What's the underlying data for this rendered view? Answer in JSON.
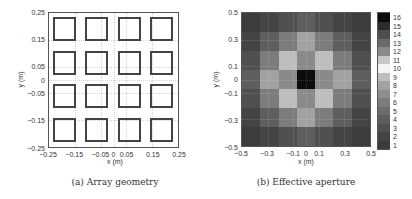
{
  "chart_data": [
    {
      "type": "scatter",
      "title": "",
      "caption": "(a)  Array geometry",
      "xlabel": "x (m)",
      "ylabel": "y (m)",
      "xlim": [
        -0.25,
        0.25
      ],
      "ylim": [
        -0.25,
        0.25
      ],
      "xticks": [
        "-0.25",
        "-0.15",
        "-0.05",
        "0",
        "0.05",
        "0.15",
        "0.25"
      ],
      "yticks": [
        "0.25",
        "0.15",
        "0.05",
        "0",
        "-0.05",
        "-0.15",
        "-0.25"
      ],
      "grid": true,
      "elements": {
        "shape": "square outline",
        "rows": 4,
        "cols": 4,
        "centers_x": [
          -0.1875,
          -0.0625,
          0.0625,
          0.1875
        ],
        "centers_y": [
          0.1875,
          0.0625,
          -0.0625,
          -0.1875
        ],
        "size": 0.1
      }
    },
    {
      "type": "heatmap",
      "title": "",
      "caption": "(b)  Effective aperture",
      "xlabel": "x (m)",
      "ylabel": "y (m)",
      "xlim": [
        -0.5,
        0.5
      ],
      "ylim": [
        -0.5,
        0.5
      ],
      "xticks": [
        "-0.5",
        "-0.3",
        "-0.1",
        "0",
        "0.1",
        "0.3",
        "0.5"
      ],
      "yticks": [
        "0.5",
        "0.3",
        "0.1",
        "0",
        "-0.1",
        "-0.3",
        "-0.5"
      ],
      "grid": true,
      "values": [
        [
          1,
          2,
          3,
          4,
          3,
          2,
          1
        ],
        [
          2,
          4,
          6,
          8,
          6,
          4,
          2
        ],
        [
          3,
          6,
          9,
          12,
          9,
          6,
          3
        ],
        [
          4,
          8,
          12,
          16,
          12,
          8,
          4
        ],
        [
          3,
          6,
          9,
          12,
          9,
          6,
          3
        ],
        [
          2,
          4,
          6,
          8,
          6,
          4,
          2
        ],
        [
          1,
          2,
          3,
          4,
          3,
          2,
          1
        ]
      ],
      "colorbar": {
        "min": 1,
        "max": 16,
        "ticks": [
          "16",
          "15",
          "14",
          "13",
          "12",
          "11",
          "10",
          "9",
          "8",
          "7",
          "6",
          "5",
          "4",
          "3",
          "2",
          "1"
        ],
        "colormap": {
          "1": "#3c3c3c",
          "2": "#444444",
          "3": "#505050",
          "4": "#5e5e5e",
          "5": "#6c6c6c",
          "6": "#7c7c7c",
          "7": "#8e8e8e",
          "8": "#a2a2a2",
          "9": "#bdbdbd",
          "10": "#f4f4f4",
          "11": "#c8c8c8",
          "12": "#8a8a8a",
          "13": "#6a6a6a",
          "14": "#4e4e4e",
          "15": "#2c2c2c",
          "16": "#0c0c0c"
        }
      }
    }
  ]
}
